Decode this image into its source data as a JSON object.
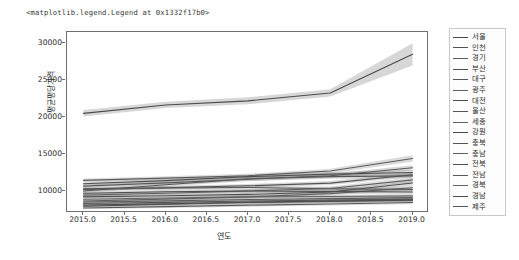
{
  "figure": {
    "repr_title": "<matplotlib.legend.Legend at 0x1332f17b0>"
  },
  "axes": {
    "xlabel": "연도",
    "ylabel": "평균평당가격",
    "xticks": [
      "2015.0",
      "2015.5",
      "2016.0",
      "2016.5",
      "2017.0",
      "2017.5",
      "2018.0",
      "2018.5",
      "2019.0"
    ],
    "yticks": [
      "10000",
      "15000",
      "20000",
      "25000",
      "30000"
    ]
  },
  "legend": {
    "entries": [
      {
        "label": "서울",
        "color": "#4a4a4a"
      },
      {
        "label": "인천",
        "color": "#525252"
      },
      {
        "label": "경기",
        "color": "#5a5a5a"
      },
      {
        "label": "부산",
        "color": "#4f4f4f"
      },
      {
        "label": "대구",
        "color": "#585858"
      },
      {
        "label": "광주",
        "color": "#616161"
      },
      {
        "label": "대전",
        "color": "#4d4d4d"
      },
      {
        "label": "울산",
        "color": "#565656"
      },
      {
        "label": "세종",
        "color": "#606060"
      },
      {
        "label": "강원",
        "color": "#4b4b4b"
      },
      {
        "label": "충북",
        "color": "#555555"
      },
      {
        "label": "충남",
        "color": "#5e5e5e"
      },
      {
        "label": "전북",
        "color": "#505050"
      },
      {
        "label": "전남",
        "color": "#595959"
      },
      {
        "label": "경북",
        "color": "#636363"
      },
      {
        "label": "경남",
        "color": "#4e4e4e"
      },
      {
        "label": "제주",
        "color": "#575757"
      }
    ]
  },
  "chart_data": {
    "type": "line",
    "title": "",
    "xlabel": "연도",
    "ylabel": "평균평당가격",
    "xlim": [
      2014.8,
      2019.2
    ],
    "ylim": [
      7000,
      31500
    ],
    "grid": false,
    "legend_position": "right-outside",
    "has_confidence_bands": true,
    "x": [
      2015,
      2016,
      2017,
      2018,
      2019
    ],
    "series": [
      {
        "name": "서울",
        "color": "#4a4a4a",
        "values": [
          20480,
          21620,
          22180,
          23250,
          28480
        ],
        "band_lo": [
          20050,
          21200,
          21720,
          22780,
          26950
        ],
        "band_hi": [
          20930,
          22060,
          22660,
          23740,
          29980
        ]
      },
      {
        "name": "인천",
        "color": "#525252",
        "values": [
          10280,
          10420,
          10680,
          11050,
          12180
        ],
        "band_lo": [
          10050,
          10180,
          10430,
          10780,
          11830
        ],
        "band_hi": [
          10510,
          10660,
          10930,
          11320,
          12530
        ]
      },
      {
        "name": "경기",
        "color": "#5a5a5a",
        "values": [
          11420,
          11720,
          12040,
          12680,
          14380
        ],
        "band_lo": [
          11180,
          11470,
          11770,
          12380,
          13950
        ],
        "band_hi": [
          11660,
          11970,
          12310,
          12980,
          14810
        ]
      },
      {
        "name": "부산",
        "color": "#4f4f4f",
        "values": [
          10950,
          11380,
          11920,
          12260,
          12480
        ],
        "band_lo": [
          10720,
          11140,
          11660,
          11980,
          12150
        ],
        "band_hi": [
          11180,
          11620,
          12180,
          12540,
          12810
        ]
      },
      {
        "name": "대구",
        "color": "#585858",
        "values": [
          10640,
          11080,
          11560,
          12050,
          13120
        ],
        "band_lo": [
          10410,
          10840,
          11300,
          11770,
          12790
        ],
        "band_hi": [
          10870,
          11320,
          11820,
          12330,
          13450
        ]
      },
      {
        "name": "광주",
        "color": "#616161",
        "values": [
          8620,
          8880,
          9180,
          9620,
          10420
        ],
        "band_lo": [
          8420,
          8670,
          8950,
          9370,
          10130
        ],
        "band_hi": [
          8820,
          9090,
          9410,
          9870,
          10710
        ]
      },
      {
        "name": "대전",
        "color": "#4d4d4d",
        "values": [
          9180,
          9340,
          9520,
          9840,
          11060
        ],
        "band_lo": [
          8970,
          9120,
          9290,
          9590,
          10740
        ],
        "band_hi": [
          9390,
          9560,
          9750,
          10090,
          11380
        ]
      },
      {
        "name": "울산",
        "color": "#565656",
        "values": [
          10180,
          10380,
          10460,
          10280,
          10180
        ],
        "band_lo": [
          9950,
          10140,
          10210,
          10020,
          9900
        ],
        "band_hi": [
          10410,
          10620,
          10710,
          10540,
          10460
        ]
      },
      {
        "name": "세종",
        "color": "#606060",
        "values": [
          9420,
          9680,
          9980,
          10320,
          11480
        ],
        "band_lo": [
          9200,
          9450,
          9730,
          10050,
          11150
        ],
        "band_hi": [
          9640,
          9910,
          10230,
          10590,
          11810
        ]
      },
      {
        "name": "강원",
        "color": "#4b4b4b",
        "values": [
          7920,
          8180,
          8460,
          8620,
          8780
        ],
        "band_lo": [
          7740,
          7990,
          8250,
          8400,
          8540
        ],
        "band_hi": [
          8100,
          8370,
          8670,
          8840,
          9020
        ]
      },
      {
        "name": "충북",
        "color": "#555555",
        "values": [
          8280,
          8440,
          8620,
          8740,
          8880
        ],
        "band_lo": [
          8090,
          8240,
          8410,
          8520,
          8640
        ],
        "band_hi": [
          8470,
          8640,
          8830,
          8960,
          9120
        ]
      },
      {
        "name": "충남",
        "color": "#5e5e5e",
        "values": [
          8480,
          8640,
          8820,
          8940,
          9080
        ],
        "band_lo": [
          8290,
          8440,
          8610,
          8720,
          8840
        ],
        "band_hi": [
          8670,
          8840,
          9030,
          9160,
          9320
        ]
      },
      {
        "name": "전북",
        "color": "#505050",
        "values": [
          8060,
          8240,
          8420,
          8560,
          8720
        ],
        "band_lo": [
          7880,
          8050,
          8210,
          8340,
          8480
        ],
        "band_hi": [
          8240,
          8430,
          8630,
          8780,
          8960
        ]
      },
      {
        "name": "전남",
        "color": "#595959",
        "values": [
          7680,
          7860,
          8060,
          8220,
          8420
        ],
        "band_lo": [
          7510,
          7680,
          7860,
          8010,
          8190
        ],
        "band_hi": [
          7850,
          8040,
          8260,
          8430,
          8650
        ]
      },
      {
        "name": "경북",
        "color": "#636363",
        "values": [
          8860,
          9040,
          9180,
          9240,
          9320
        ],
        "band_lo": [
          8660,
          8830,
          8960,
          9010,
          9070
        ],
        "band_hi": [
          9060,
          9250,
          9400,
          9470,
          9570
        ]
      },
      {
        "name": "경남",
        "color": "#4e4e4e",
        "values": [
          9680,
          9880,
          9980,
          9920,
          9840
        ],
        "band_lo": [
          9460,
          9650,
          9740,
          9670,
          9580
        ],
        "band_hi": [
          9900,
          10110,
          10220,
          10170,
          10100
        ]
      },
      {
        "name": "제주",
        "color": "#575757",
        "values": [
          9980,
          10820,
          11640,
          11920,
          12020
        ],
        "band_lo": [
          9740,
          10560,
          11360,
          11620,
          11690
        ],
        "band_hi": [
          10220,
          11080,
          11920,
          12220,
          12350
        ]
      }
    ]
  }
}
